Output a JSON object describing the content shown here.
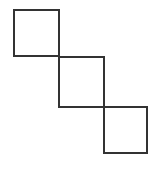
{
  "diagram": {
    "stroke_color": "#333333",
    "stroke_width": 2,
    "background": "#ffffff",
    "shapes": [
      {
        "type": "square",
        "x": 14,
        "y": 10,
        "width": 45,
        "height": 46
      },
      {
        "type": "square",
        "x": 59,
        "y": 57,
        "width": 45,
        "height": 50
      },
      {
        "type": "square",
        "x": 104,
        "y": 107,
        "width": 43,
        "height": 46
      }
    ]
  }
}
